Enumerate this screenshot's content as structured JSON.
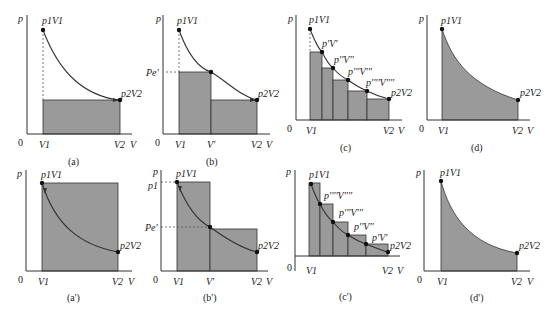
{
  "figure": {
    "caption_text": "",
    "fill_color": "#9a9a9a",
    "line_color": "#333333",
    "panels": [
      {
        "id": "a",
        "caption": "(a)",
        "row": 0,
        "col": 0,
        "description": "Single-step expansion: area rectangle at p2 from V1 to V2",
        "labels": {
          "p": "p",
          "origin": "0",
          "V1": "V1",
          "V2": "V2",
          "V": "V",
          "start": "p1V1",
          "end": "p2V2"
        }
      },
      {
        "id": "b",
        "caption": "(b)",
        "row": 0,
        "col": 1,
        "description": "Two-step expansion with intermediate pressure pe'",
        "labels": {
          "p": "p",
          "origin": "0",
          "V1": "V1",
          "Vmid": "V'",
          "V2": "V2",
          "V": "V",
          "start": "p1V1",
          "end": "p2V2",
          "pe": "Pe'"
        }
      },
      {
        "id": "c",
        "caption": "(c)",
        "row": 0,
        "col": 2,
        "description": "Multi-step expansion",
        "labels": {
          "p": "p",
          "origin": "0",
          "V1": "V1",
          "V2": "V2",
          "V": "V",
          "start": "p1V1",
          "end": "p2V2",
          "steps": [
            "p'V'",
            "p''V''",
            "p'''V'''",
            "p''''V''''"
          ]
        }
      },
      {
        "id": "d",
        "caption": "(d)",
        "row": 0,
        "col": 3,
        "description": "Reversible expansion: area under curve",
        "labels": {
          "p": "p",
          "origin": "0",
          "V1": "V1",
          "V2": "V2",
          "V": "V",
          "start": "p1V1",
          "end": "p2V2"
        }
      },
      {
        "id": "a-prime",
        "caption": "(a')",
        "row": 1,
        "col": 0,
        "description": "Single-step compression: rectangle at p1",
        "labels": {
          "p": "p",
          "origin": "0",
          "V1": "V1",
          "V2": "V2",
          "V": "V",
          "start": "p1V1",
          "end": "p2V2"
        }
      },
      {
        "id": "b-prime",
        "caption": "(b')",
        "row": 1,
        "col": 1,
        "description": "Two-step compression",
        "labels": {
          "p": "p",
          "origin": "0",
          "V1": "V1",
          "Vmid": "V'",
          "V2": "V2",
          "V": "V",
          "start": "p1V1",
          "end": "p2V2",
          "p1": "p1",
          "pe": "Pe'"
        }
      },
      {
        "id": "c-prime",
        "caption": "(c')",
        "row": 1,
        "col": 2,
        "description": "Multi-step compression",
        "labels": {
          "p": "p",
          "origin": "0",
          "V1": "V1",
          "V2": "V2",
          "V": "V",
          "start": "p1V1",
          "end": "p2V2",
          "steps": [
            "p''''V''''",
            "p'''V'''",
            "p''V''",
            "p'V'"
          ]
        }
      },
      {
        "id": "d-prime",
        "caption": "(d')",
        "row": 1,
        "col": 3,
        "description": "Reversible compression: area under curve",
        "labels": {
          "p": "p",
          "origin": "0",
          "V1": "V1",
          "V2": "V2",
          "V": "V",
          "start": "p1V1",
          "end": "p2V2"
        }
      }
    ]
  }
}
